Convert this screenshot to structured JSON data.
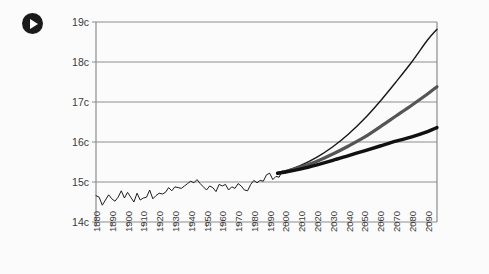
{
  "figure": {
    "play_icon_name": "play-icon",
    "background_color": "#fbfbfb"
  },
  "chart_data": {
    "type": "line",
    "title": "",
    "subtitle": "",
    "xlabel": "",
    "ylabel": "",
    "grid": "horizontal",
    "legend_position": "none",
    "xlim": [
      1880,
      2096
    ],
    "ylim": [
      14,
      19
    ],
    "x_tick_labels": [
      "1880",
      "1890",
      "1900",
      "1910",
      "1920",
      "1930",
      "1940",
      "1950",
      "1960",
      "1970",
      "1980",
      "1990",
      "2000",
      "2010",
      "2020",
      "2030",
      "2040",
      "2050",
      "2060",
      "2070",
      "2080",
      "2090"
    ],
    "x_tick_values": [
      1880,
      1890,
      1900,
      1910,
      1920,
      1930,
      1940,
      1950,
      1960,
      1970,
      1980,
      1990,
      2000,
      2010,
      2020,
      2030,
      2040,
      2050,
      2060,
      2070,
      2080,
      2090
    ],
    "y_tick_labels": [
      "14c",
      "15c",
      "16c",
      "17c",
      "18c",
      "19c"
    ],
    "y_tick_values": [
      14,
      15,
      16,
      17,
      18,
      19
    ],
    "series": [
      {
        "name": "observed-temperature",
        "style": "thin-jagged",
        "color": "#1c1c1c",
        "x": [
          1880,
          1882,
          1884,
          1886,
          1888,
          1890,
          1892,
          1894,
          1896,
          1898,
          1900,
          1902,
          1904,
          1906,
          1908,
          1910,
          1912,
          1914,
          1916,
          1918,
          1920,
          1922,
          1924,
          1926,
          1928,
          1930,
          1932,
          1934,
          1936,
          1938,
          1940,
          1942,
          1944,
          1946,
          1948,
          1950,
          1952,
          1954,
          1956,
          1958,
          1960,
          1962,
          1964,
          1966,
          1968,
          1970,
          1972,
          1974,
          1976,
          1978,
          1980,
          1982,
          1984,
          1986,
          1988,
          1990,
          1992,
          1994,
          1996,
          1998,
          2000
        ],
        "y": [
          14.66,
          14.62,
          14.42,
          14.55,
          14.68,
          14.58,
          14.52,
          14.62,
          14.78,
          14.6,
          14.74,
          14.62,
          14.5,
          14.72,
          14.55,
          14.6,
          14.62,
          14.8,
          14.58,
          14.66,
          14.72,
          14.7,
          14.74,
          14.86,
          14.78,
          14.88,
          14.86,
          14.84,
          14.9,
          14.96,
          15.02,
          14.98,
          15.06,
          14.96,
          14.88,
          14.8,
          14.9,
          14.86,
          14.76,
          14.94,
          14.9,
          14.94,
          14.8,
          14.88,
          14.84,
          14.96,
          14.9,
          14.8,
          14.78,
          14.94,
          15.04,
          14.98,
          15.04,
          15.02,
          15.18,
          15.22,
          15.06,
          15.14,
          15.12,
          15.28,
          15.22
        ]
      },
      {
        "name": "high-projection",
        "style": "thin-smooth",
        "color": "#171717",
        "x": [
          1995,
          2000,
          2010,
          2020,
          2030,
          2040,
          2050,
          2060,
          2070,
          2080,
          2090,
          2096
        ],
        "y": [
          15.22,
          15.27,
          15.42,
          15.62,
          15.88,
          16.2,
          16.58,
          17.02,
          17.5,
          18.0,
          18.55,
          18.82
        ]
      },
      {
        "name": "mid-projection",
        "style": "thick-gray",
        "color": "#555555",
        "x": [
          1995,
          2000,
          2010,
          2020,
          2030,
          2040,
          2050,
          2060,
          2070,
          2080,
          2090,
          2096
        ],
        "y": [
          15.22,
          15.26,
          15.38,
          15.52,
          15.7,
          15.9,
          16.12,
          16.38,
          16.65,
          16.92,
          17.2,
          17.38
        ]
      },
      {
        "name": "low-projection",
        "style": "thick-black",
        "color": "#111111",
        "x": [
          1995,
          2000,
          2010,
          2020,
          2030,
          2040,
          2050,
          2060,
          2070,
          2080,
          2090,
          2096
        ],
        "y": [
          15.22,
          15.25,
          15.33,
          15.43,
          15.54,
          15.66,
          15.78,
          15.9,
          16.02,
          16.13,
          16.26,
          16.36
        ]
      }
    ]
  }
}
